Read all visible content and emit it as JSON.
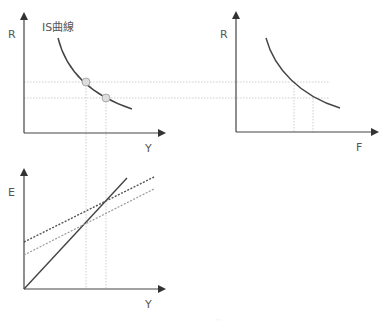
{
  "diagram": {
    "top_left": {
      "y_axis_label": "R",
      "x_axis_label": "Y",
      "curve_label": "IS曲線",
      "points": [
        {
          "x": 86,
          "y": 82
        },
        {
          "x": 106,
          "y": 98
        }
      ]
    },
    "top_right": {
      "y_axis_label": "R",
      "x_axis_label": "F"
    },
    "bottom_left": {
      "y_axis_label": "E",
      "x_axis_label": "Y",
      "lines": [
        {
          "name": "45-degree line",
          "style": "solid"
        },
        {
          "name": "aggregate expenditure (high)",
          "style": "dashed-dark"
        },
        {
          "name": "aggregate expenditure (low)",
          "style": "dashed-light"
        }
      ]
    },
    "footer_faint_text": "···"
  },
  "colors": {
    "axis": "#444444",
    "curve": "#444444",
    "guide": "#cccccc",
    "point_fill": "#dddddd"
  }
}
